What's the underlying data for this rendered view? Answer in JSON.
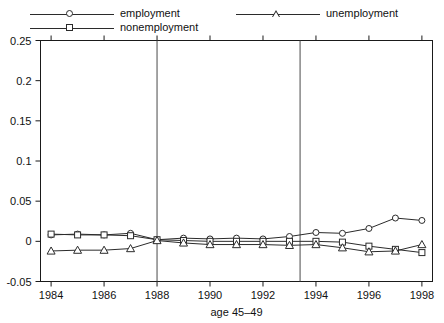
{
  "chart_data": {
    "type": "line",
    "title": "",
    "xlabel": "age 45–49",
    "ylabel": "",
    "xlim": [
      1983.6,
      1998.4
    ],
    "ylim": [
      -0.05,
      0.25
    ],
    "xticks": [
      1984,
      1986,
      1988,
      1990,
      1992,
      1994,
      1996,
      1998
    ],
    "xticklabels": [
      "1984",
      "1986",
      "1988",
      "1990",
      "1992",
      "1994",
      "1996",
      "1998"
    ],
    "yticks": [
      -0.05,
      0,
      0.05,
      0.1,
      0.15,
      0.2,
      0.25
    ],
    "yticklabels": [
      "-0.05",
      "0",
      "0.05",
      "0.1",
      "0.15",
      "0.2",
      "0.25"
    ],
    "grid": false,
    "legend_position": "above-plot",
    "vlines": [
      1988.0,
      1993.4
    ],
    "x": [
      1984,
      1985,
      1986,
      1987,
      1988,
      1989,
      1990,
      1991,
      1992,
      1993,
      1994,
      1995,
      1996,
      1997,
      1998
    ],
    "series": [
      {
        "name": "employment",
        "marker": "circle",
        "values": [
          0.008,
          0.009,
          0.008,
          0.01,
          0.002,
          0.004,
          0.003,
          0.004,
          0.003,
          0.006,
          0.011,
          0.01,
          0.016,
          0.029,
          0.026
        ]
      },
      {
        "name": "nonemployment",
        "marker": "square",
        "values": [
          0.009,
          0.008,
          0.008,
          0.007,
          0.002,
          0.001,
          0.0,
          0.0,
          0.0,
          0.0,
          0.0,
          -0.001,
          -0.006,
          -0.01,
          -0.014
        ]
      },
      {
        "name": "unemployment",
        "marker": "triangle",
        "values": [
          -0.012,
          -0.011,
          -0.011,
          -0.009,
          0.001,
          -0.002,
          -0.004,
          -0.004,
          -0.004,
          -0.005,
          -0.004,
          -0.008,
          -0.013,
          -0.012,
          -0.004
        ]
      }
    ],
    "colors": {
      "line": "#2b2b2b",
      "frame": "#1a1a1a",
      "vline": "#4a4a4a",
      "background": "#ffffff"
    }
  },
  "legend": {
    "items": [
      {
        "label": "employment",
        "marker": "circle"
      },
      {
        "label": "nonemployment",
        "marker": "square"
      },
      {
        "label": "unemployment",
        "marker": "triangle"
      }
    ]
  }
}
